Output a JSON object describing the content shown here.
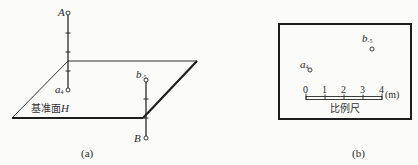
{
  "panel_a": {
    "caption": "(a)",
    "plane_label": "基准面",
    "plane_label_italic": "H",
    "point_A": {
      "name": "A"
    },
    "point_a": {
      "name": "a",
      "subscript": "4"
    },
    "point_b": {
      "name": "b",
      "subscript": "-5"
    },
    "point_B": {
      "name": "B"
    }
  },
  "panel_b": {
    "caption": "(b)",
    "point_a": {
      "name": "a",
      "subscript": "4"
    },
    "point_b": {
      "name": "b",
      "subscript": "-5"
    },
    "scale": {
      "ticks": [
        "0",
        "1",
        "2",
        "3",
        "4"
      ],
      "unit": "(m)",
      "label": "比例尺"
    }
  },
  "colors": {
    "line": "#2a2a2a",
    "background": "#fbfbfa"
  }
}
